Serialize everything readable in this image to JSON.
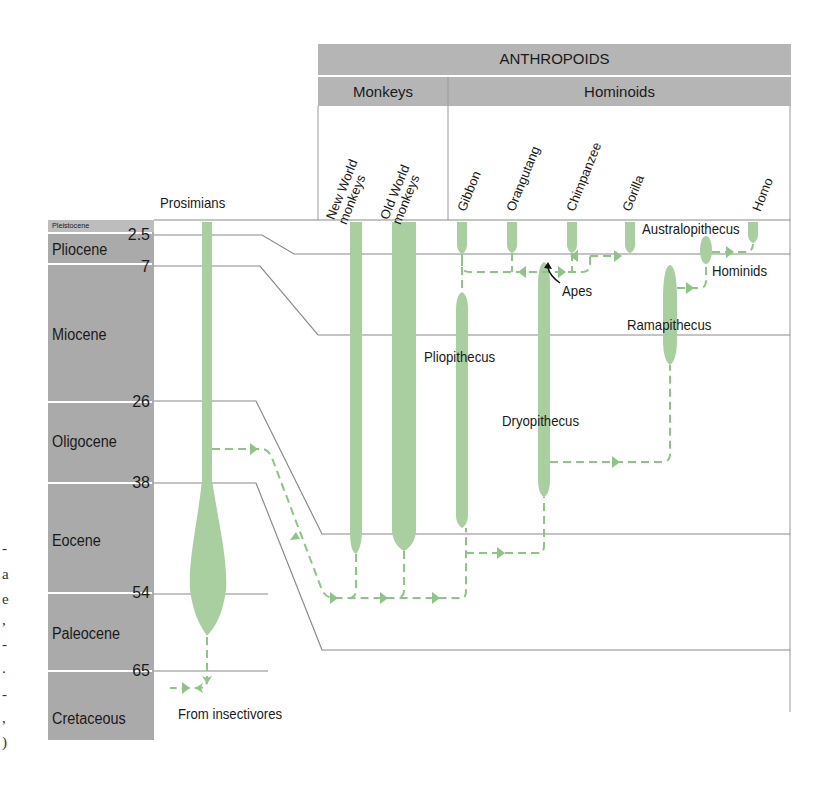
{
  "header": {
    "group": "ANTHROPOIDS",
    "subgroups": [
      "Monkeys",
      "Hominoids"
    ],
    "prosimians": "Prosimians"
  },
  "taxa": [
    "New World monkeys",
    "Old World monkeys",
    "Gibbon",
    "Orangutang",
    "Chimpanzee",
    "Gorilla",
    "Homo"
  ],
  "taxa_lines": {
    "nw1": "New World",
    "nw2": "monkeys",
    "ow1": "Old World",
    "ow2": "monkeys"
  },
  "epochs": [
    {
      "name": "Pleistocene",
      "boundary_mya": null
    },
    {
      "name": "Pliocene",
      "boundary_mya": "2.5"
    },
    {
      "name": "Miocene",
      "boundary_mya": "7"
    },
    {
      "name": "Oligocene",
      "boundary_mya": "26"
    },
    {
      "name": "Eocene",
      "boundary_mya": "38"
    },
    {
      "name": "Paleocene",
      "boundary_mya": "54"
    },
    {
      "name": "Cretaceous",
      "boundary_mya": "65"
    }
  ],
  "boundaries": [
    "2.5",
    "7",
    "26",
    "38",
    "54",
    "65"
  ],
  "fossil_labels": {
    "australopithecus": "Australopithecus",
    "hominids": "Hominids",
    "apes": "Apes",
    "ramapithecus": "Ramapithecus",
    "pliopithecus": "Pliopithecus",
    "dryopithecus": "Dryopithecus",
    "insectivores": "From insectivores"
  },
  "caption_fragments": [
    "-",
    "a",
    "e",
    ",",
    "-",
    ".",
    "-",
    ",",
    ")"
  ],
  "colors": {
    "branch": "#a9cfa0",
    "dash": "#8fc487",
    "header_bg": "#b3b3b3",
    "timescale_bg": "#ababab",
    "boundary_line": "#8a8a8a"
  }
}
